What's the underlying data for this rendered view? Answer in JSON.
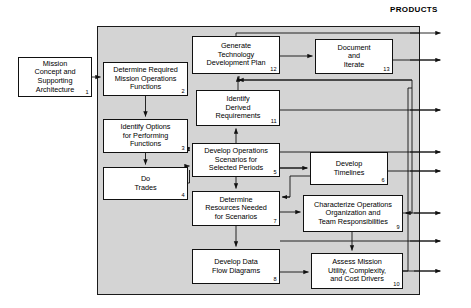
{
  "diagram": {
    "title_label": "PRODUCTS",
    "container_name": "mission-operations-process-container",
    "nodes": [
      {
        "id": "n1",
        "name": "mission-concept-architecture",
        "text": "Mission\nConcept and\nSupporting\nArchitecture",
        "number": "1",
        "x": 18,
        "y": 57,
        "w": 74,
        "h": 40
      },
      {
        "id": "n2",
        "name": "determine-required-mission-operations-functions",
        "text": "Determine Required\nMission Operations\nFunctions",
        "number": "2",
        "x": 103,
        "y": 62,
        "w": 85,
        "h": 34
      },
      {
        "id": "n3",
        "name": "identify-options-for-performing-functions",
        "text": "Identify Options\nfor Performing\nFunctions",
        "number": "3",
        "x": 103,
        "y": 119,
        "w": 85,
        "h": 34
      },
      {
        "id": "n4",
        "name": "do-trades",
        "text": "Do\nTrades",
        "number": "4",
        "x": 103,
        "y": 167,
        "w": 85,
        "h": 33
      },
      {
        "id": "n5",
        "name": "develop-operations-scenarios-selected-periods",
        "text": "Develop Operations\nScenarios for\nSelected Periods",
        "number": "5",
        "x": 192,
        "y": 143,
        "w": 88,
        "h": 34
      },
      {
        "id": "n6",
        "name": "develop-timelines",
        "text": "Develop\nTimelines",
        "number": "6",
        "x": 310,
        "y": 152,
        "w": 78,
        "h": 33
      },
      {
        "id": "n7",
        "name": "determine-resources-needed-scenarios",
        "text": "Determine\nResources Needed\nfor Scenarios",
        "number": "7",
        "x": 192,
        "y": 191,
        "w": 88,
        "h": 35
      },
      {
        "id": "n8",
        "name": "develop-data-flow-diagrams",
        "text": "Develop Data\nFlow Diagrams",
        "number": "8",
        "x": 192,
        "y": 249,
        "w": 88,
        "h": 35
      },
      {
        "id": "n9",
        "name": "characterize-operations-organization-team-responsibilities",
        "text": "Characterize Operations\nOrganization and\nTeam Responsibilities",
        "number": "9",
        "x": 303,
        "y": 195,
        "w": 100,
        "h": 37
      },
      {
        "id": "n10",
        "name": "assess-mission-utility-complexity-cost-drivers",
        "text": "Assess Mission\nUtility, Complexity,\nand Cost Drivers",
        "number": "10",
        "x": 311,
        "y": 253,
        "w": 92,
        "h": 36
      },
      {
        "id": "n11",
        "name": "identify-derived-requirements",
        "text": "Identify\nDerived\nRequirements",
        "number": "11",
        "x": 196,
        "y": 90,
        "w": 84,
        "h": 36
      },
      {
        "id": "n12",
        "name": "generate-technology-development-plan",
        "text": "Generate\nTechnology\nDevelopment Plan",
        "number": "12",
        "x": 192,
        "y": 36,
        "w": 88,
        "h": 38
      },
      {
        "id": "n13",
        "name": "document-and-iterate",
        "text": "Document\nand\nIterate",
        "number": "13",
        "x": 315,
        "y": 39,
        "w": 78,
        "h": 35
      }
    ],
    "colors": {
      "panel_fill": "#d4d4d4",
      "node_fill": "#ffffff",
      "stroke": "#111111",
      "text": "#000000"
    }
  }
}
